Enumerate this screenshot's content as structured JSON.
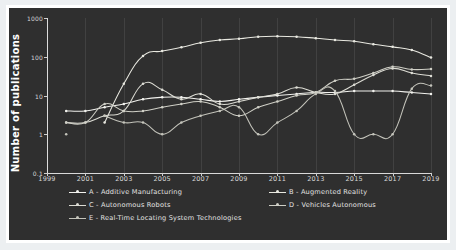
{
  "chart": {
    "type": "line",
    "title": "",
    "xlabel": "",
    "ylabel": "Number of publications",
    "yscale": "log",
    "ylim": [
      0.1,
      1000
    ],
    "ytick_labels": [
      "1000",
      "100",
      "10",
      "1",
      "0.1"
    ],
    "xlim": [
      1999,
      2019
    ],
    "xtick_labels": [
      "1999",
      "2001",
      "2003",
      "2005",
      "2007",
      "2009",
      "2011",
      "2013",
      "2015",
      "2017",
      "2019"
    ],
    "grid": "vertical",
    "legend_position": "below-plot",
    "background_color": "#2f2f2f",
    "frame_color": "#ffffff",
    "text_color": "#d7d7d7"
  },
  "chart_data": {
    "type": "line",
    "title": "",
    "xlabel": "",
    "ylabel": "Number of publications",
    "yscale": "log",
    "ylim": [
      0.1,
      1000
    ],
    "xlim": [
      1999,
      2019
    ],
    "grid": "vertical",
    "legend_position": "below-plot",
    "x": [
      1999,
      2000,
      2001,
      2002,
      2003,
      2004,
      2005,
      2006,
      2007,
      2008,
      2009,
      2010,
      2011,
      2012,
      2013,
      2014,
      2015,
      2016,
      2017,
      2018,
      2019
    ],
    "categories": [
      "1999",
      "2000",
      "2001",
      "2002",
      "2003",
      "2004",
      "2005",
      "2006",
      "2007",
      "2008",
      "2009",
      "2010",
      "2011",
      "2012",
      "2013",
      "2014",
      "2015",
      "2016",
      "2017",
      "2018",
      "2019"
    ],
    "series": [
      {
        "name": "A - Additive Manufacturing",
        "key": "A",
        "color": "#f2f2ee",
        "values": [
          null,
          4,
          4,
          5,
          6,
          8,
          9,
          9,
          8,
          7,
          8,
          9,
          10,
          11,
          12,
          12,
          13,
          13,
          13,
          12,
          11
        ]
      },
      {
        "name": "B - Augmented Reality",
        "key": "B",
        "color": "#e8e8e0",
        "values": [
          null,
          null,
          null,
          2,
          20,
          105,
          140,
          175,
          230,
          270,
          290,
          330,
          340,
          330,
          300,
          270,
          250,
          210,
          180,
          150,
          95
        ]
      },
      {
        "name": "C - Autonomous Robots",
        "key": "C",
        "color": "#dcdcd4",
        "values": [
          null,
          2,
          2,
          3,
          4,
          20,
          14,
          8,
          11,
          6,
          7,
          9,
          11,
          16,
          12,
          11,
          19,
          34,
          50,
          38,
          32
        ]
      },
      {
        "name": "D - Vehicles Autonomous",
        "key": "D",
        "color": "#cfcfc6",
        "values": [
          null,
          2,
          2,
          6,
          4,
          4,
          5,
          6,
          7,
          5,
          3,
          5,
          7,
          10,
          12,
          24,
          27,
          38,
          55,
          47,
          48
        ]
      },
      {
        "name": "E - Real-Time Locating System Technologies",
        "key": "E",
        "color": "#c4c4bb",
        "values": [
          null,
          1,
          null,
          3,
          2,
          2,
          1,
          2,
          3,
          4,
          5,
          1,
          2,
          4,
          11,
          13,
          1,
          1,
          1,
          15,
          18
        ]
      }
    ]
  },
  "legend": {
    "items": [
      {
        "label": "A - Additive Manufacturing",
        "color": "#f2f2ee"
      },
      {
        "label": "B - Augmented Reality",
        "color": "#e8e8e0"
      },
      {
        "label": "C - Autonomous Robots",
        "color": "#dcdcd4"
      },
      {
        "label": "D - Vehicles Autonomous",
        "color": "#cfcfc6"
      },
      {
        "label": "E - Real-Time Locating System Technologies",
        "color": "#c4c4bb"
      }
    ]
  }
}
